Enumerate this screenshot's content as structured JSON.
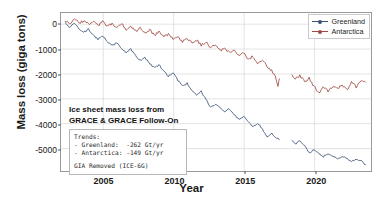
{
  "chart_data": {
    "type": "line",
    "title": "",
    "xlabel": "Year",
    "ylabel": "Mass loss (giga tons)",
    "xlim": [
      2002.0,
      2024.0
    ],
    "ylim": [
      -5900,
      450
    ],
    "xticks": [
      2005,
      2010,
      2015,
      2020
    ],
    "yticks": [
      0,
      -1000,
      -2000,
      -3000,
      -4000,
      -5000
    ],
    "ytick_labels": [
      "0",
      "-1000",
      "-2000",
      "-3000",
      "-4000",
      "-5000"
    ],
    "xtick_labels": [
      "2005",
      "2010",
      "2015",
      "2020"
    ],
    "grid": true,
    "legend_position": "upper right",
    "series": [
      {
        "name": "Greenland",
        "color": "#3b5277",
        "trend_gt_per_yr": -262,
        "segments": [
          {
            "mission": "GRACE",
            "x_start": 2002.3,
            "x_end": 2017.5,
            "anchors": [
              [
                2002.3,
                60
              ],
              [
                2002.6,
                -120
              ],
              [
                2002.95,
                40
              ],
              [
                2003.3,
                -190
              ],
              [
                2003.62,
                -330
              ],
              [
                2003.95,
                -210
              ],
              [
                2004.3,
                -430
              ],
              [
                2004.62,
                -600
              ],
              [
                2004.95,
                -470
              ],
              [
                2005.3,
                -700
              ],
              [
                2005.62,
                -870
              ],
              [
                2005.95,
                -740
              ],
              [
                2006.3,
                -980
              ],
              [
                2006.62,
                -1140
              ],
              [
                2006.95,
                -1010
              ],
              [
                2007.3,
                -1270
              ],
              [
                2007.62,
                -1450
              ],
              [
                2007.95,
                -1330
              ],
              [
                2008.3,
                -1590
              ],
              [
                2008.62,
                -1760
              ],
              [
                2008.95,
                -1640
              ],
              [
                2009.3,
                -1900
              ],
              [
                2009.62,
                -2090
              ],
              [
                2009.95,
                -1960
              ],
              [
                2010.3,
                -2260
              ],
              [
                2010.62,
                -2490
              ],
              [
                2010.95,
                -2380
              ],
              [
                2011.3,
                -2650
              ],
              [
                2011.62,
                -2830
              ],
              [
                2011.95,
                -2710
              ],
              [
                2012.3,
                -3020
              ],
              [
                2012.62,
                -3360
              ],
              [
                2012.95,
                -3210
              ],
              [
                2013.3,
                -3380
              ],
              [
                2013.62,
                -3520
              ],
              [
                2013.95,
                -3400
              ],
              [
                2014.3,
                -3620
              ],
              [
                2014.62,
                -3830
              ],
              [
                2014.95,
                -3700
              ],
              [
                2015.3,
                -3900
              ],
              [
                2015.62,
                -4100
              ],
              [
                2015.95,
                -3980
              ],
              [
                2016.3,
                -4220
              ],
              [
                2016.62,
                -4520
              ],
              [
                2016.95,
                -4400
              ],
              [
                2017.3,
                -4560
              ],
              [
                2017.5,
                -4640
              ]
            ]
          },
          {
            "mission": "GRACE Follow-On",
            "x_start": 2018.4,
            "x_end": 2023.6,
            "anchors": [
              [
                2018.4,
                -4700
              ],
              [
                2018.62,
                -4820
              ],
              [
                2018.95,
                -4700
              ],
              [
                2019.3,
                -4900
              ],
              [
                2019.62,
                -5170
              ],
              [
                2019.95,
                -5060
              ],
              [
                2020.3,
                -5180
              ],
              [
                2020.62,
                -5320
              ],
              [
                2020.95,
                -5210
              ],
              [
                2021.3,
                -5300
              ],
              [
                2021.62,
                -5420
              ],
              [
                2021.95,
                -5320
              ],
              [
                2022.3,
                -5400
              ],
              [
                2022.62,
                -5520
              ],
              [
                2022.95,
                -5420
              ],
              [
                2023.3,
                -5500
              ],
              [
                2023.6,
                -5640
              ]
            ]
          }
        ]
      },
      {
        "name": "Antarctica",
        "color": "#a14a42",
        "trend_gt_per_yr": -149,
        "segments": [
          {
            "mission": "GRACE",
            "x_start": 2002.3,
            "x_end": 2017.5,
            "anchors": [
              [
                2002.3,
                120
              ],
              [
                2002.6,
                20
              ],
              [
                2002.95,
                210
              ],
              [
                2003.3,
                30
              ],
              [
                2003.62,
                150
              ],
              [
                2003.95,
                10
              ],
              [
                2004.3,
                120
              ],
              [
                2004.62,
                -60
              ],
              [
                2004.95,
                90
              ],
              [
                2005.3,
                -100
              ],
              [
                2005.62,
                40
              ],
              [
                2005.95,
                -140
              ],
              [
                2006.3,
                10
              ],
              [
                2006.62,
                -220
              ],
              [
                2006.95,
                -70
              ],
              [
                2007.3,
                -280
              ],
              [
                2007.62,
                -160
              ],
              [
                2007.95,
                -360
              ],
              [
                2008.3,
                -240
              ],
              [
                2008.62,
                -440
              ],
              [
                2008.95,
                -320
              ],
              [
                2009.3,
                -520
              ],
              [
                2009.62,
                -400
              ],
              [
                2009.95,
                -620
              ],
              [
                2010.3,
                -500
              ],
              [
                2010.62,
                -700
              ],
              [
                2010.95,
                -580
              ],
              [
                2011.3,
                -760
              ],
              [
                2011.62,
                -640
              ],
              [
                2011.95,
                -840
              ],
              [
                2012.3,
                -720
              ],
              [
                2012.62,
                -960
              ],
              [
                2012.95,
                -830
              ],
              [
                2013.3,
                -1060
              ],
              [
                2013.62,
                -940
              ],
              [
                2013.95,
                -1160
              ],
              [
                2014.3,
                -1040
              ],
              [
                2014.62,
                -1280
              ],
              [
                2014.95,
                -1160
              ],
              [
                2015.3,
                -1400
              ],
              [
                2015.62,
                -1300
              ],
              [
                2015.95,
                -1560
              ],
              [
                2016.3,
                -1440
              ],
              [
                2016.62,
                -1700
              ],
              [
                2016.95,
                -1880
              ],
              [
                2017.2,
                -2060
              ],
              [
                2017.4,
                -2450
              ],
              [
                2017.5,
                -2200
              ]
            ]
          },
          {
            "mission": "GRACE Follow-On",
            "x_start": 2018.4,
            "x_end": 2023.6,
            "anchors": [
              [
                2018.4,
                -2020
              ],
              [
                2018.62,
                -2220
              ],
              [
                2018.95,
                -2080
              ],
              [
                2019.3,
                -2300
              ],
              [
                2019.62,
                -2180
              ],
              [
                2019.95,
                -2500
              ],
              [
                2020.3,
                -2760
              ],
              [
                2020.62,
                -2560
              ],
              [
                2020.95,
                -2680
              ],
              [
                2021.3,
                -2480
              ],
              [
                2021.62,
                -2600
              ],
              [
                2021.95,
                -2420
              ],
              [
                2022.3,
                -2620
              ],
              [
                2022.62,
                -2340
              ],
              [
                2022.95,
                -2520
              ],
              [
                2023.3,
                -2280
              ],
              [
                2023.6,
                -2330
              ]
            ]
          }
        ]
      }
    ]
  },
  "legend": {
    "items": [
      {
        "label": "Greenland",
        "color": "#3b5277"
      },
      {
        "label": "Antarctica",
        "color": "#a14a42"
      }
    ]
  },
  "annotation": {
    "line1": "Ice sheet mass loss from",
    "line2": "GRACE & GRACE Follow-On",
    "trends_header": "Trends:",
    "trend_greenland": "- Greenland:  -262 Gt/yr",
    "trend_antarctica": "- Antarctica: -149 Gt/yr",
    "gia_note": "GIA Removed (ICE-6G)"
  },
  "colors": {
    "greenland": "#3b5277",
    "antarctica": "#a14a42",
    "grid": "#dcdcdc",
    "frame": "#9a9a9a",
    "background": "#ffffff"
  }
}
